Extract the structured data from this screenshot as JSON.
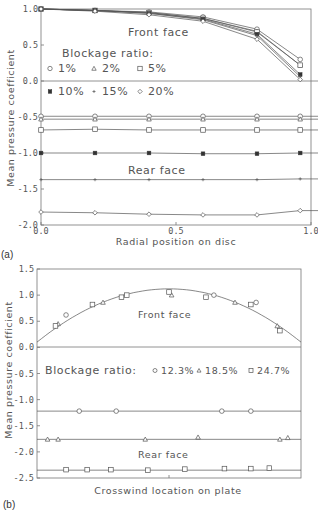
{
  "chart_data": [
    {
      "panel": "(a)",
      "type": "line",
      "xlabel": "Radial position on disc",
      "ylabel": "Mean pressure coefficient",
      "xlim": [
        0.0,
        1.0
      ],
      "ylim": [
        -2.0,
        1.0
      ],
      "xticks": [
        "0.0",
        "0.5",
        "1.0"
      ],
      "yticks": [
        "1.0",
        "0.5",
        "0.0",
        "-0.5",
        "-1.0",
        "-1.5",
        "-2.0"
      ],
      "annotations": [
        "Front face",
        "Rear face"
      ],
      "legend_title": "Blockage ratio:",
      "legend": [
        {
          "label": "1%",
          "marker": "circle"
        },
        {
          "label": "2%",
          "marker": "triangle"
        },
        {
          "label": "5%",
          "marker": "square"
        },
        {
          "label": "10%",
          "marker": "filled-square"
        },
        {
          "label": "15%",
          "marker": "plus"
        },
        {
          "label": "20%",
          "marker": "diamond"
        }
      ],
      "x": [
        0.0,
        0.2,
        0.4,
        0.6,
        0.8,
        0.96
      ],
      "series": [
        {
          "name": "1% front",
          "marker": "circle",
          "values": [
            1.0,
            0.98,
            0.96,
            0.89,
            0.72,
            0.3
          ]
        },
        {
          "name": "2% front",
          "marker": "triangle",
          "values": [
            1.0,
            0.98,
            0.95,
            0.87,
            0.69,
            0.22
          ]
        },
        {
          "name": "5% front",
          "marker": "square",
          "values": [
            1.0,
            0.98,
            0.95,
            0.87,
            0.68,
            0.22
          ]
        },
        {
          "name": "10% front",
          "marker": "filled-square",
          "values": [
            1.0,
            0.98,
            0.94,
            0.86,
            0.65,
            0.09
          ]
        },
        {
          "name": "15% front",
          "marker": "plus",
          "values": [
            1.0,
            0.98,
            0.94,
            0.85,
            0.63,
            0.06
          ]
        },
        {
          "name": "20% front",
          "marker": "diamond",
          "values": [
            1.0,
            0.97,
            0.92,
            0.83,
            0.58,
            0.02
          ]
        },
        {
          "name": "1% rear",
          "marker": "circle",
          "values": [
            -0.49,
            -0.49,
            -0.49,
            -0.49,
            -0.49,
            -0.49
          ]
        },
        {
          "name": "2% rear",
          "marker": "triangle",
          "values": [
            -0.53,
            -0.53,
            -0.53,
            -0.53,
            -0.53,
            -0.53
          ]
        },
        {
          "name": "5% rear",
          "marker": "square",
          "values": [
            -0.68,
            -0.67,
            -0.68,
            -0.68,
            -0.68,
            -0.68
          ]
        },
        {
          "name": "10% rear",
          "marker": "filled-square",
          "values": [
            -1.0,
            -1.0,
            -1.0,
            -1.01,
            -1.01,
            -1.0
          ]
        },
        {
          "name": "15% rear",
          "marker": "plus",
          "values": [
            -1.37,
            -1.37,
            -1.37,
            -1.37,
            -1.37,
            -1.36
          ]
        },
        {
          "name": "20% rear",
          "marker": "diamond",
          "values": [
            -1.82,
            -1.83,
            -1.85,
            -1.86,
            -1.86,
            -1.8
          ]
        }
      ]
    },
    {
      "panel": "(b)",
      "type": "scatter",
      "xlabel": "Crosswind location on plate",
      "ylabel": "Mean pressure coefficient",
      "xlim": [
        0.0,
        1.0
      ],
      "ylim": [
        -2.5,
        1.5
      ],
      "yticks": [
        "1.5",
        "1.0",
        "0.5",
        "0.0",
        "-0.5",
        "-1.0",
        "-1.5",
        "-2.0",
        "-2.5"
      ],
      "annotations": [
        "Front face",
        "Rear face"
      ],
      "legend_title": "Blockage ratio:",
      "legend": [
        {
          "label": "12.3%",
          "marker": "circle"
        },
        {
          "label": "18.5%",
          "marker": "triangle"
        },
        {
          "label": "24.7%",
          "marker": "square"
        }
      ],
      "front_fit_curve": {
        "type": "parabola",
        "peak_x": 0.5,
        "peak_y": 1.12,
        "edge_y": 0.1
      },
      "series": [
        {
          "name": "12.3% front",
          "marker": "circle",
          "x": [
            0.11,
            0.67,
            0.83
          ],
          "values": [
            0.62,
            1.0,
            0.86
          ]
        },
        {
          "name": "18.5% front",
          "marker": "triangle",
          "x": [
            0.08,
            0.25,
            0.51,
            0.75,
            0.91
          ],
          "values": [
            0.45,
            0.86,
            1.0,
            0.86,
            0.41
          ]
        },
        {
          "name": "24.7% front",
          "marker": "square",
          "x": [
            0.07,
            0.21,
            0.32,
            0.34,
            0.5,
            0.64,
            0.81,
            0.92
          ],
          "values": [
            0.41,
            0.82,
            0.96,
            1.0,
            1.06,
            0.96,
            0.82,
            0.32
          ]
        },
        {
          "name": "12.3% rear",
          "marker": "circle",
          "line": -1.22,
          "x": [
            0.16,
            0.3,
            0.7,
            0.81
          ],
          "values": [
            -1.22,
            -1.22,
            -1.22,
            -1.22
          ]
        },
        {
          "name": "18.5% rear",
          "marker": "triangle",
          "line": -1.76,
          "x": [
            0.04,
            0.08,
            0.41,
            0.61,
            0.92,
            0.95
          ],
          "values": [
            -1.76,
            -1.76,
            -1.76,
            -1.72,
            -1.76,
            -1.73
          ]
        },
        {
          "name": "24.7% rear",
          "marker": "square",
          "line": -2.35,
          "x": [
            0.11,
            0.19,
            0.28,
            0.42,
            0.56,
            0.71,
            0.81,
            0.88
          ],
          "values": [
            -2.34,
            -2.34,
            -2.34,
            -2.35,
            -2.33,
            -2.32,
            -2.32,
            -2.31
          ]
        }
      ]
    }
  ]
}
